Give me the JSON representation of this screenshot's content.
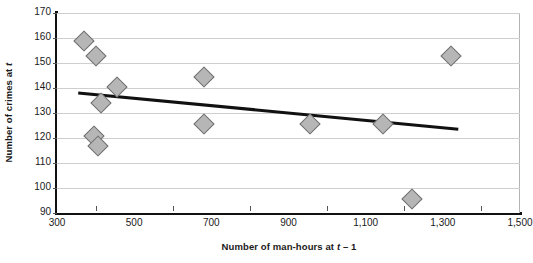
{
  "chart_data": {
    "type": "scatter",
    "title": "",
    "xlabel": "Number of man-hours at t – 1",
    "xlabel_parts": {
      "before": "Number of man-hours at ",
      "italic": "t",
      "after": " – 1"
    },
    "ylabel": "Number of crimes at t",
    "ylabel_parts": {
      "before": "Number of crimes at ",
      "italic": "t",
      "after": ""
    },
    "xlim": [
      300,
      1500
    ],
    "ylim": [
      90,
      170
    ],
    "xticks": [
      300,
      500,
      700,
      900,
      1100,
      1300,
      1500
    ],
    "xtick_labels": [
      "300",
      "500",
      "700",
      "900",
      "1,100",
      "1,300",
      "1,500"
    ],
    "x_minor_ticks": [
      400,
      600,
      800,
      1000,
      1200,
      1400
    ],
    "yticks": [
      90,
      100,
      110,
      120,
      130,
      140,
      150,
      160,
      170
    ],
    "ytick_labels": [
      "90",
      "100",
      "110",
      "120",
      "130",
      "140",
      "150",
      "160",
      "170"
    ],
    "grid": "horizontal",
    "legend": "none",
    "marker_shape": "diamond",
    "marker_color": "#b6b6b6",
    "marker_edge_color": "#6e6e6e",
    "points": [
      {
        "x": 370,
        "y": 159.0
      },
      {
        "x": 400,
        "y": 153.0
      },
      {
        "x": 455,
        "y": 140.5
      },
      {
        "x": 415,
        "y": 134.0
      },
      {
        "x": 395,
        "y": 121.0
      },
      {
        "x": 405,
        "y": 117.0
      },
      {
        "x": 680,
        "y": 144.5
      },
      {
        "x": 680,
        "y": 125.5
      },
      {
        "x": 955,
        "y": 125.5
      },
      {
        "x": 1145,
        "y": 125.5
      },
      {
        "x": 1220,
        "y": 95.5
      },
      {
        "x": 1320,
        "y": 153.0
      }
    ],
    "trendline": {
      "type": "linear",
      "color": "#111111",
      "x_start": 355,
      "y_start": 138.0,
      "x_end": 1340,
      "y_end": 123.5
    }
  }
}
